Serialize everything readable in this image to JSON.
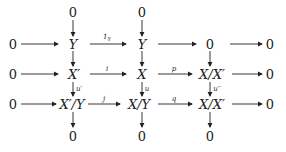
{
  "diagram": {
    "type": "commutative-diagram",
    "nodes": {
      "top_0_a": "0",
      "top_0_b": "0",
      "r1_0": "0",
      "r1_Y": "Y",
      "r1_Y2": "Y",
      "r1_zero": "0",
      "r1_end": "0",
      "r2_0": "0",
      "r2_Xp": "X′",
      "r2_X": "X",
      "r2_XXp": "X/X′",
      "r2_end": "0",
      "r3_0": "0",
      "r3_XpY": "X′/Y",
      "r3_XY": "X/Y",
      "r3_XXp": "X/X′",
      "r3_end": "0",
      "bot_0_a": "0",
      "bot_0_b": "0",
      "bot_0_c": "0"
    },
    "labels": {
      "one_Y": "1",
      "one_Y_sub": "Y",
      "i": "i",
      "p": "p",
      "u_prime": "u′",
      "u": "u",
      "u_dprime": "u′′",
      "j": "j",
      "q": "q"
    }
  }
}
